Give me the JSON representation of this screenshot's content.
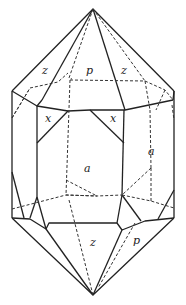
{
  "figure": {
    "labels": [
      {
        "id": "z1",
        "text": "z",
        "x": 42,
        "y": 74
      },
      {
        "id": "p1",
        "text": "p",
        "x": 86,
        "y": 74
      },
      {
        "id": "z2",
        "text": "z",
        "x": 121,
        "y": 74
      },
      {
        "id": "x1",
        "text": "x",
        "x": 45,
        "y": 122
      },
      {
        "id": "x2",
        "text": "x",
        "x": 110,
        "y": 122
      },
      {
        "id": "a1",
        "text": "a",
        "x": 84,
        "y": 172
      },
      {
        "id": "a2",
        "text": "a",
        "x": 148,
        "y": 155
      },
      {
        "id": "z3",
        "text": "z",
        "x": 90,
        "y": 246
      },
      {
        "id": "p2",
        "text": "p",
        "x": 133,
        "y": 244
      }
    ]
  }
}
